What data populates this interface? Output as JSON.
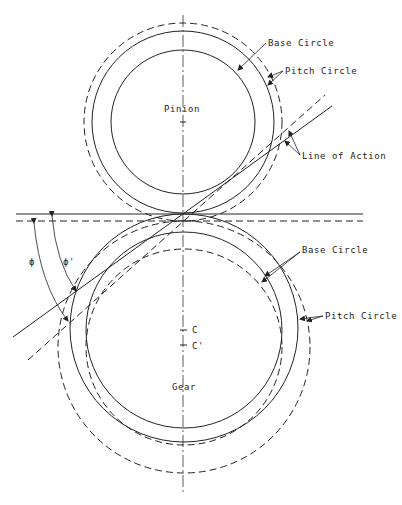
{
  "pinion": {
    "label": "Pinion",
    "base_circle_label": "Base Circle",
    "pitch_circle_label": "Pitch Circle"
  },
  "gear": {
    "label": "Gear",
    "base_circle_label": "Base Circle",
    "pitch_circle_label": "Pitch Circle",
    "center_label": "C",
    "shifted_center_label": "C'"
  },
  "line_of_action_label": "Line of Action",
  "angles": {
    "phi": "ϕ",
    "phi_prime": "ϕ'"
  },
  "colors": {
    "line": "#222222",
    "background": "#ffffff"
  }
}
